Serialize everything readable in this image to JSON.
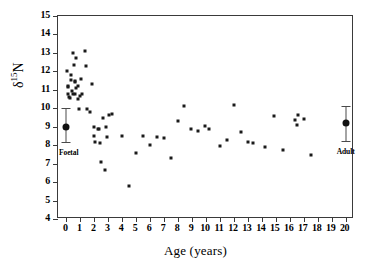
{
  "chart_data": {
    "type": "scatter",
    "title": "",
    "xlabel": "Age (years)",
    "ylabel_delta": "δ",
    "ylabel_sup": "15",
    "ylabel_element": "N",
    "xlim": [
      -0.6,
      20.6
    ],
    "ylim": [
      4,
      15
    ],
    "xticks": [
      0,
      1,
      2,
      3,
      4,
      5,
      6,
      7,
      8,
      9,
      10,
      11,
      12,
      13,
      14,
      15,
      16,
      17,
      18,
      19,
      20
    ],
    "yticks": [
      4,
      5,
      6,
      7,
      8,
      9,
      10,
      11,
      12,
      13,
      14,
      15
    ],
    "grid": false,
    "legend": false,
    "marker_color": "#1a1a1a",
    "axis_color": "#3a3a3a",
    "series": [
      {
        "name": "individuals",
        "points": [
          [
            0.05,
            12.0
          ],
          [
            0.1,
            11.2
          ],
          [
            0.12,
            11.15
          ],
          [
            0.15,
            10.75
          ],
          [
            0.2,
            10.6
          ],
          [
            0.25,
            10.55
          ],
          [
            0.3,
            11.8
          ],
          [
            0.35,
            11.55
          ],
          [
            0.4,
            10.95
          ],
          [
            0.45,
            10.75
          ],
          [
            0.5,
            13.0
          ],
          [
            0.55,
            12.35
          ],
          [
            0.6,
            11.45
          ],
          [
            0.62,
            11.5
          ],
          [
            0.65,
            10.75
          ],
          [
            0.7,
            12.7
          ],
          [
            0.72,
            11.1
          ],
          [
            0.8,
            11.2
          ],
          [
            0.85,
            10.5
          ],
          [
            0.9,
            9.95
          ],
          [
            1.0,
            10.65
          ],
          [
            1.05,
            11.6
          ],
          [
            1.15,
            10.8
          ],
          [
            1.3,
            13.1
          ],
          [
            1.4,
            12.3
          ],
          [
            1.5,
            9.95
          ],
          [
            1.7,
            9.8
          ],
          [
            1.85,
            11.3
          ],
          [
            1.95,
            9.0
          ],
          [
            2.0,
            8.5
          ],
          [
            2.05,
            8.15
          ],
          [
            2.3,
            8.85
          ],
          [
            2.35,
            8.9
          ],
          [
            2.4,
            8.1
          ],
          [
            2.45,
            7.1
          ],
          [
            2.6,
            9.5
          ],
          [
            2.8,
            6.65
          ],
          [
            2.85,
            9.0
          ],
          [
            2.9,
            8.45
          ],
          [
            3.05,
            9.65
          ],
          [
            3.3,
            9.7
          ],
          [
            4.0,
            8.5
          ],
          [
            4.5,
            5.8
          ],
          [
            5.0,
            7.55
          ],
          [
            5.5,
            8.5
          ],
          [
            6.0,
            8.0
          ],
          [
            6.5,
            8.45
          ],
          [
            7.0,
            8.4
          ],
          [
            7.5,
            7.3
          ],
          [
            8.0,
            9.3
          ],
          [
            8.4,
            10.1
          ],
          [
            8.9,
            8.85
          ],
          [
            9.4,
            8.75
          ],
          [
            9.9,
            9.05
          ],
          [
            10.2,
            8.9
          ],
          [
            11.0,
            7.95
          ],
          [
            11.5,
            8.3
          ],
          [
            12.0,
            10.2
          ],
          [
            12.5,
            8.7
          ],
          [
            13.0,
            8.15
          ],
          [
            13.4,
            8.1
          ],
          [
            14.2,
            7.9
          ],
          [
            14.9,
            9.6
          ],
          [
            15.5,
            7.75
          ],
          [
            16.4,
            9.35
          ],
          [
            16.5,
            9.1
          ],
          [
            16.6,
            9.65
          ],
          [
            17.0,
            9.4
          ],
          [
            17.5,
            7.45
          ]
        ]
      }
    ],
    "summary_markers": [
      {
        "label": "Foetal",
        "x": 0.0,
        "y": 9.0,
        "error_low": 8.15,
        "error_high": 10.0
      },
      {
        "label": "Adult",
        "x": 20.0,
        "y": 9.2,
        "error_low": 8.25,
        "error_high": 10.1
      }
    ]
  }
}
